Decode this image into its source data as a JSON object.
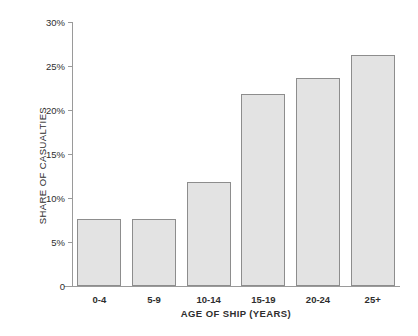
{
  "chart_data": {
    "type": "bar",
    "title": "",
    "xlabel": "AGE OF SHIP (YEARS)",
    "ylabel": "SHARE OF CASUALTIES",
    "categories": [
      "0-4",
      "5-9",
      "10-14",
      "15-19",
      "20-24",
      "25+"
    ],
    "values": [
      7.6,
      7.6,
      11.8,
      21.8,
      23.6,
      26.2
    ],
    "ylim": [
      0,
      30
    ],
    "yticks": [
      0,
      5,
      10,
      15,
      20,
      25,
      30
    ],
    "ytick_labels": [
      "0",
      "5%",
      "10%",
      "15%",
      "20%",
      "25%",
      "30%"
    ],
    "grid": false,
    "legend": false,
    "bar_fill": "#e3e3e3",
    "bar_border": "#8d8d8d",
    "axis_color": "#9a9a9a",
    "background": "#ffffff"
  }
}
